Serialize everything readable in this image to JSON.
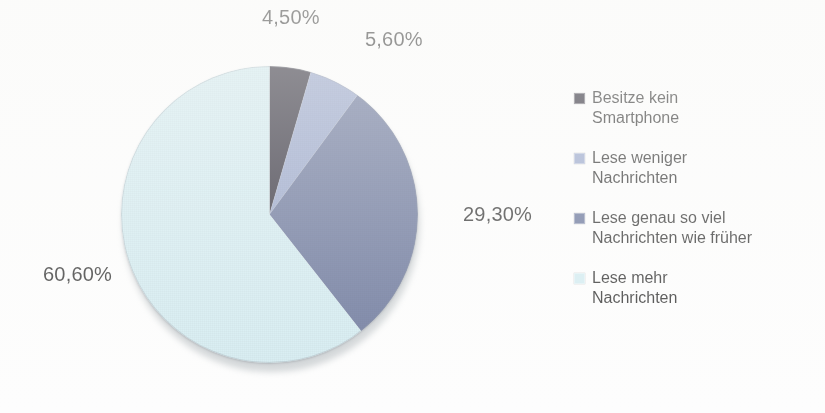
{
  "chart_data": {
    "type": "pie",
    "title": "",
    "subtitle": "",
    "xlabel": "",
    "ylabel": "",
    "legend_position": "right",
    "grid": false,
    "start_angle_deg": 0,
    "direction": "clockwise",
    "categories": [
      "Besitze kein Smartphone",
      "Lese weniger Nachrichten",
      "Lese genau so viel Nachrichten wie früher",
      "Lese mehr Nachrichten"
    ],
    "values": [
      4.5,
      5.6,
      29.3,
      60.6
    ],
    "value_labels": [
      "4,50%",
      "5,60%",
      "29,30%",
      "60,60%"
    ],
    "colors": [
      "#120f1e",
      "#8a9ac4",
      "#54628d",
      "#cde9ef"
    ],
    "units": "%",
    "total": 100.0
  },
  "slices": [
    {
      "label": "4,50%",
      "value": 4.5,
      "color": "#120f1e",
      "name": "besitze-kein-smartphone"
    },
    {
      "label": "5,60%",
      "value": 5.6,
      "color": "#8a9ac4",
      "name": "lese-weniger-nachrichten"
    },
    {
      "label": "29,30%",
      "value": 29.3,
      "color": "#54628d",
      "name": "lese-genau-so-viel-nachrichten-wie-frueher"
    },
    {
      "label": "60,60%",
      "value": 60.6,
      "color": "#cde9ef",
      "name": "lese-mehr-nachrichten"
    }
  ],
  "legend": {
    "items": [
      {
        "label": "Besitze kein\nSmartphone",
        "color": "#120f1e"
      },
      {
        "label": "Lese weniger\nNachrichten",
        "color": "#8a9ac4"
      },
      {
        "label": "Lese genau so viel\nNachrichten wie früher",
        "color": "#54628d"
      },
      {
        "label": "Lese mehr\nNachrichten",
        "color": "#cde9ef"
      }
    ]
  }
}
